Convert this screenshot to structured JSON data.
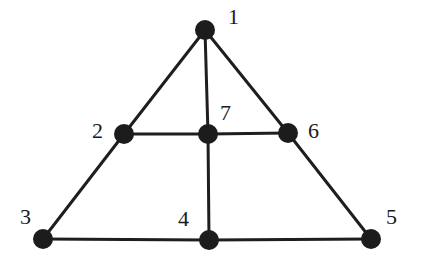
{
  "diagram": {
    "type": "graph",
    "nodes": [
      {
        "id": "1",
        "label": "1",
        "x": 205,
        "y": 30,
        "lx": 228,
        "ly": 24
      },
      {
        "id": "2",
        "label": "2",
        "x": 124,
        "y": 134,
        "lx": 92,
        "ly": 138
      },
      {
        "id": "3",
        "label": "3",
        "x": 43,
        "y": 239,
        "lx": 20,
        "ly": 224
      },
      {
        "id": "4",
        "label": "4",
        "x": 209,
        "y": 240,
        "lx": 178,
        "ly": 226
      },
      {
        "id": "5",
        "label": "5",
        "x": 371,
        "y": 239,
        "lx": 386,
        "ly": 224
      },
      {
        "id": "6",
        "label": "6",
        "x": 288,
        "y": 133,
        "lx": 308,
        "ly": 138
      },
      {
        "id": "7",
        "label": "7",
        "x": 208,
        "y": 134,
        "lx": 220,
        "ly": 120
      }
    ],
    "edges": [
      [
        "1",
        "2"
      ],
      [
        "2",
        "3"
      ],
      [
        "1",
        "7"
      ],
      [
        "7",
        "4"
      ],
      [
        "1",
        "6"
      ],
      [
        "6",
        "5"
      ],
      [
        "2",
        "7"
      ],
      [
        "7",
        "6"
      ],
      [
        "3",
        "4"
      ],
      [
        "4",
        "5"
      ]
    ]
  }
}
